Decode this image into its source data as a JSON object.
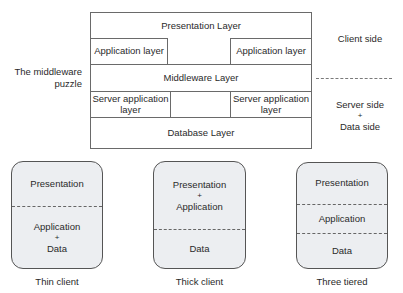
{
  "middleware_diagram": {
    "left_label_line1": "The middleware",
    "left_label_line2": "puzzle",
    "presentation_layer": "Presentation Layer",
    "application_layer_left": "Application layer",
    "application_layer_right": "Application layer",
    "middleware_layer": "Middleware Layer",
    "server_app_left_line1": "Server application",
    "server_app_left_line2": "layer",
    "server_app_right_line1": "Server application",
    "server_app_right_line2": "layer",
    "database_layer": "Database Layer",
    "client_side": "Client side",
    "server_side_line1": "Server side",
    "server_side_plus": "+",
    "server_side_line2": "Data side"
  },
  "tiers": {
    "thin": {
      "top": "Presentation",
      "bottom_line1": "Application",
      "bottom_plus": "+",
      "bottom_line2": "Data",
      "caption": "Thin client"
    },
    "thick": {
      "top_line1": "Presentation",
      "top_plus": "+",
      "top_line2": "Application",
      "bottom": "Data",
      "caption": "Thick client"
    },
    "three": {
      "top": "Presentation",
      "middle": "Application",
      "bottom": "Data",
      "caption": "Three tiered"
    }
  }
}
